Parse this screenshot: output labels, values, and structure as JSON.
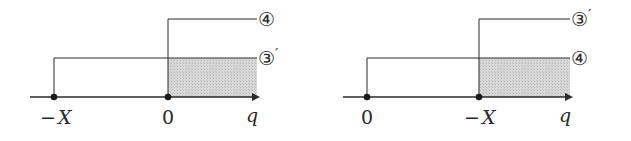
{
  "panels": [
    {
      "id": "left",
      "axis_label": "q",
      "points": [
        {
          "label_minus": "−",
          "label_var": "X"
        },
        {
          "label": "0"
        }
      ],
      "upper_line_label": "④",
      "lower_line_label": "③",
      "lower_line_prime": "′",
      "upper_line_prime": ""
    },
    {
      "id": "right",
      "axis_label": "q",
      "points": [
        {
          "label": "0"
        },
        {
          "label_minus": "−",
          "label_var": "X"
        }
      ],
      "upper_line_label": "③",
      "upper_line_prime": "′",
      "lower_line_label": "④",
      "lower_line_prime": ""
    }
  ],
  "colors": {
    "line": "#2a2a2a",
    "shade": "#cfcfcf"
  }
}
